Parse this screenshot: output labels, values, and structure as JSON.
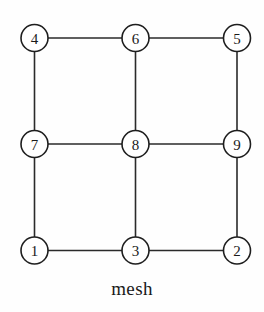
{
  "figure": {
    "caption": "mesh",
    "title": "mesh",
    "width": 264,
    "height": 312,
    "background_color": "#fefefe",
    "stroke_color": "#1e1e1e",
    "node_fill_color": "#ffffff",
    "label_color": "#1a1a1a"
  },
  "graph": {
    "name": "mesh",
    "node_radius": 13.5,
    "nodes": [
      {
        "id": "4",
        "label": "4",
        "cx": 34.5,
        "cy": 38.0,
        "row": 0,
        "col": 0
      },
      {
        "id": "6",
        "label": "6",
        "cx": 135.5,
        "cy": 38.0,
        "row": 0,
        "col": 1
      },
      {
        "id": "5",
        "label": "5",
        "cx": 237.0,
        "cy": 38.0,
        "row": 0,
        "col": 2
      },
      {
        "id": "7",
        "label": "7",
        "cx": 34.5,
        "cy": 144.0,
        "row": 1,
        "col": 0
      },
      {
        "id": "8",
        "label": "8",
        "cx": 135.5,
        "cy": 144.0,
        "row": 1,
        "col": 1
      },
      {
        "id": "9",
        "label": "9",
        "cx": 237.0,
        "cy": 144.0,
        "row": 1,
        "col": 2
      },
      {
        "id": "1",
        "label": "1",
        "cx": 34.5,
        "cy": 250.5,
        "row": 2,
        "col": 0
      },
      {
        "id": "3",
        "label": "3",
        "cx": 135.5,
        "cy": 250.5,
        "row": 2,
        "col": 1
      },
      {
        "id": "2",
        "label": "2",
        "cx": 237.0,
        "cy": 250.5,
        "row": 2,
        "col": 2
      }
    ],
    "edges": [
      {
        "from": "4",
        "to": "6"
      },
      {
        "from": "6",
        "to": "5"
      },
      {
        "from": "7",
        "to": "8"
      },
      {
        "from": "8",
        "to": "9"
      },
      {
        "from": "1",
        "to": "3"
      },
      {
        "from": "3",
        "to": "2"
      },
      {
        "from": "4",
        "to": "7"
      },
      {
        "from": "7",
        "to": "1"
      },
      {
        "from": "6",
        "to": "8"
      },
      {
        "from": "8",
        "to": "3"
      },
      {
        "from": "5",
        "to": "9"
      },
      {
        "from": "9",
        "to": "2"
      }
    ]
  }
}
